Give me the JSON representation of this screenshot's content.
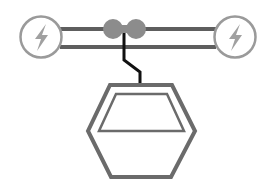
{
  "illustration": {
    "subject": "cable car",
    "colors": {
      "background": "#ffffff",
      "outline": "#6b6b6b",
      "station_circle": "#9a9a9a",
      "bolt": "#a0a0a0",
      "pulley": "#8c8c8c",
      "hanger_cable": "#111111",
      "rail": "#5e5e5e"
    },
    "stations": [
      {
        "name": "left-station",
        "icon": "lightning-bolt-icon",
        "cx": 41,
        "cy": 37,
        "r": 21
      },
      {
        "name": "right-station",
        "icon": "lightning-bolt-icon",
        "cx": 235,
        "cy": 37,
        "r": 21
      }
    ],
    "rails": [
      {
        "y": 29,
        "x1": 62,
        "x2": 214
      },
      {
        "y": 47,
        "x1": 62,
        "x2": 214
      }
    ],
    "pulleys": [
      {
        "cx": 113,
        "cy": 29,
        "r": 10
      },
      {
        "cx": 136,
        "cy": 29,
        "r": 10
      }
    ]
  }
}
